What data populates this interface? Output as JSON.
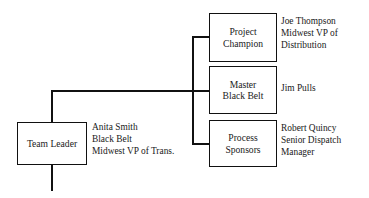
{
  "diagram": {
    "nodes": [
      {
        "id": "team-leader",
        "box_lines": [
          "Team Leader"
        ],
        "person": {
          "name": "Anita Smith",
          "role": "Black Belt",
          "title": "Midwest VP of Trans."
        }
      },
      {
        "id": "project-champion",
        "box_lines": [
          "Project",
          "Champion"
        ],
        "person": {
          "name": "Joe Thompson",
          "role": "Midwest VP of",
          "title": "Distribution"
        }
      },
      {
        "id": "master-black-belt",
        "box_lines": [
          "Master",
          "Black Belt"
        ],
        "person": {
          "name": "Jim Pulls",
          "role": "",
          "title": ""
        }
      },
      {
        "id": "process-sponsors",
        "box_lines": [
          "Process",
          "Sponsors"
        ],
        "person": {
          "name": "Robert Quincy",
          "role": "Senior Dispatch",
          "title": "Manager"
        }
      }
    ],
    "colors": {
      "background": "#ffffff",
      "line": "#111111",
      "text": "#1a1a1a"
    }
  }
}
